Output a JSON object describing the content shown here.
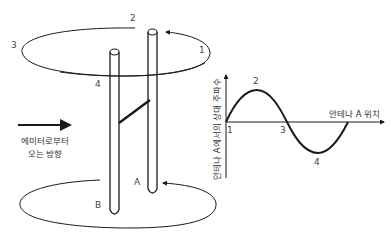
{
  "diagram": {
    "title": "",
    "antenna_labels": {
      "a": "A",
      "b": "B"
    },
    "rotation_points": {
      "p1": "1",
      "p2": "2",
      "p3": "3",
      "p4": "4"
    },
    "emitter_direction": {
      "line1": "에미터로부터",
      "line2": "오는 방향"
    },
    "graph": {
      "y_axis_label": "안테나 A에서의 상대 주파수",
      "x_axis_label": "안테나 A 위치",
      "points": {
        "p1": "1",
        "p2": "2",
        "p3": "3",
        "p4": "4"
      }
    },
    "colors": {
      "line": "#1a1a1a",
      "text": "#444444",
      "background": "#ffffff"
    }
  }
}
